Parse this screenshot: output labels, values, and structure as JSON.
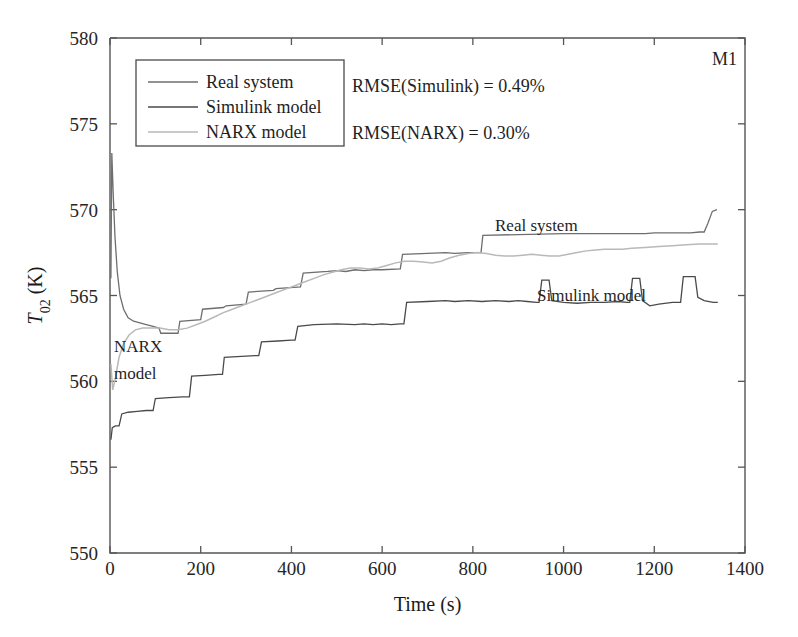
{
  "panel": {
    "id": "M1"
  },
  "annotations": {
    "rmse_simulink": "RMSE(Simulink) = 0.49%",
    "rmse_narx": "RMSE(NARX) = 0.30%",
    "label_real": "Real system",
    "label_simulink": "Simulink model",
    "label_narx_line1": "NARX",
    "label_narx_line2": "model"
  },
  "chart_data": {
    "type": "line",
    "title": "",
    "xlabel": "Time (s)",
    "ylabel": "T02 (K)",
    "ylabel_base": "T",
    "ylabel_sub": "02",
    "ylabel_unit": " (K)",
    "xlim": [
      0,
      1400
    ],
    "ylim": [
      550,
      580
    ],
    "xticks": [
      0,
      200,
      400,
      600,
      800,
      1000,
      1200,
      1400
    ],
    "yticks": [
      550,
      555,
      560,
      565,
      570,
      575,
      580
    ],
    "xtick_labels": [
      "0",
      "200",
      "400",
      "600",
      "800",
      "1000",
      "1200",
      "1400"
    ],
    "ytick_labels": [
      "550",
      "555",
      "560",
      "565",
      "570",
      "575",
      "580"
    ],
    "grid": false,
    "legend_position": "upper-left",
    "colors": {
      "real_system": "#6e6e6e",
      "simulink_model": "#4a4a4a",
      "narx_model": "#b9b9b9",
      "axis": "#555555",
      "text": "#1f1f1f"
    },
    "series": [
      {
        "name": "Real system",
        "color": "#6e6e6e",
        "width": 1.3,
        "points": [
          [
            2,
            566.0
          ],
          [
            4,
            573.3
          ],
          [
            7,
            571.0
          ],
          [
            11,
            568.4
          ],
          [
            16,
            566.4
          ],
          [
            22,
            565.0
          ],
          [
            30,
            564.2
          ],
          [
            40,
            563.7
          ],
          [
            52,
            563.5
          ],
          [
            66,
            563.4
          ],
          [
            80,
            563.3
          ],
          [
            95,
            563.2
          ],
          [
            108,
            563.1
          ],
          [
            112,
            562.8
          ],
          [
            150,
            562.8
          ],
          [
            154,
            563.5
          ],
          [
            200,
            563.6
          ],
          [
            204,
            564.2
          ],
          [
            250,
            564.3
          ],
          [
            256,
            564.4
          ],
          [
            300,
            564.5
          ],
          [
            305,
            565.2
          ],
          [
            360,
            565.3
          ],
          [
            366,
            565.4
          ],
          [
            420,
            565.5
          ],
          [
            426,
            566.3
          ],
          [
            480,
            566.4
          ],
          [
            500,
            566.45
          ],
          [
            520,
            566.4
          ],
          [
            540,
            566.5
          ],
          [
            560,
            566.45
          ],
          [
            580,
            566.5
          ],
          [
            600,
            566.5
          ],
          [
            640,
            566.55
          ],
          [
            645,
            567.4
          ],
          [
            700,
            567.45
          ],
          [
            740,
            567.5
          ],
          [
            760,
            567.45
          ],
          [
            790,
            567.5
          ],
          [
            800,
            567.5
          ],
          [
            818,
            567.5
          ],
          [
            822,
            568.5
          ],
          [
            900,
            568.55
          ],
          [
            1000,
            568.6
          ],
          [
            1100,
            568.6
          ],
          [
            1180,
            568.6
          ],
          [
            1200,
            568.65
          ],
          [
            1280,
            568.65
          ],
          [
            1300,
            568.7
          ],
          [
            1310,
            568.7
          ],
          [
            1318,
            569.2
          ],
          [
            1328,
            569.9
          ],
          [
            1338,
            570.0
          ]
        ]
      },
      {
        "name": "NARX model",
        "color": "#b9b9b9",
        "width": 1.5,
        "points": [
          [
            2,
            561.0
          ],
          [
            6,
            559.5
          ],
          [
            12,
            560.2
          ],
          [
            20,
            561.4
          ],
          [
            30,
            562.2
          ],
          [
            42,
            562.7
          ],
          [
            56,
            563.0
          ],
          [
            72,
            563.1
          ],
          [
            90,
            563.1
          ],
          [
            110,
            563.1
          ],
          [
            130,
            563.0
          ],
          [
            150,
            563.0
          ],
          [
            170,
            563.1
          ],
          [
            190,
            563.3
          ],
          [
            210,
            563.5
          ],
          [
            230,
            563.75
          ],
          [
            250,
            564.0
          ],
          [
            270,
            564.2
          ],
          [
            290,
            564.4
          ],
          [
            310,
            564.6
          ],
          [
            330,
            564.8
          ],
          [
            350,
            565.0
          ],
          [
            370,
            565.2
          ],
          [
            390,
            565.4
          ],
          [
            410,
            565.6
          ],
          [
            430,
            565.8
          ],
          [
            450,
            566.0
          ],
          [
            470,
            566.2
          ],
          [
            490,
            566.35
          ],
          [
            510,
            566.5
          ],
          [
            530,
            566.6
          ],
          [
            550,
            566.6
          ],
          [
            570,
            566.55
          ],
          [
            590,
            566.6
          ],
          [
            610,
            566.75
          ],
          [
            630,
            566.9
          ],
          [
            650,
            567.0
          ],
          [
            670,
            567.0
          ],
          [
            690,
            566.95
          ],
          [
            710,
            566.9
          ],
          [
            730,
            567.0
          ],
          [
            750,
            567.2
          ],
          [
            770,
            567.35
          ],
          [
            790,
            567.45
          ],
          [
            810,
            567.5
          ],
          [
            830,
            567.45
          ],
          [
            850,
            567.35
          ],
          [
            870,
            567.3
          ],
          [
            890,
            567.3
          ],
          [
            910,
            567.35
          ],
          [
            930,
            567.4
          ],
          [
            950,
            567.35
          ],
          [
            970,
            567.3
          ],
          [
            990,
            567.3
          ],
          [
            1010,
            567.4
          ],
          [
            1030,
            567.5
          ],
          [
            1050,
            567.6
          ],
          [
            1070,
            567.65
          ],
          [
            1090,
            567.7
          ],
          [
            1110,
            567.7
          ],
          [
            1130,
            567.7
          ],
          [
            1150,
            567.75
          ],
          [
            1180,
            567.8
          ],
          [
            1210,
            567.85
          ],
          [
            1240,
            567.9
          ],
          [
            1270,
            567.95
          ],
          [
            1300,
            568.0
          ],
          [
            1330,
            568.0
          ],
          [
            1340,
            568.0
          ]
        ]
      },
      {
        "name": "Simulink model",
        "color": "#4a4a4a",
        "width": 1.3,
        "points": [
          [
            2,
            556.6
          ],
          [
            5,
            557.3
          ],
          [
            12,
            557.4
          ],
          [
            20,
            557.4
          ],
          [
            26,
            558.1
          ],
          [
            40,
            558.2
          ],
          [
            60,
            558.25
          ],
          [
            80,
            558.3
          ],
          [
            95,
            558.3
          ],
          [
            100,
            559.0
          ],
          [
            130,
            559.05
          ],
          [
            160,
            559.1
          ],
          [
            175,
            559.1
          ],
          [
            180,
            560.3
          ],
          [
            210,
            560.35
          ],
          [
            240,
            560.4
          ],
          [
            248,
            560.4
          ],
          [
            252,
            561.4
          ],
          [
            290,
            561.45
          ],
          [
            320,
            561.5
          ],
          [
            328,
            561.5
          ],
          [
            334,
            562.3
          ],
          [
            370,
            562.35
          ],
          [
            400,
            562.4
          ],
          [
            408,
            562.4
          ],
          [
            414,
            563.2
          ],
          [
            450,
            563.3
          ],
          [
            500,
            563.35
          ],
          [
            540,
            563.3
          ],
          [
            560,
            563.35
          ],
          [
            580,
            563.3
          ],
          [
            600,
            563.35
          ],
          [
            620,
            563.3
          ],
          [
            640,
            563.35
          ],
          [
            648,
            563.35
          ],
          [
            654,
            564.6
          ],
          [
            700,
            564.65
          ],
          [
            740,
            564.7
          ],
          [
            760,
            564.65
          ],
          [
            790,
            564.7
          ],
          [
            820,
            564.65
          ],
          [
            850,
            564.7
          ],
          [
            880,
            564.65
          ],
          [
            900,
            564.7
          ],
          [
            920,
            564.65
          ],
          [
            940,
            564.6
          ],
          [
            946,
            564.6
          ],
          [
            952,
            565.9
          ],
          [
            968,
            565.9
          ],
          [
            974,
            564.7
          ],
          [
            1000,
            564.6
          ],
          [
            1030,
            564.55
          ],
          [
            1060,
            564.6
          ],
          [
            1090,
            564.6
          ],
          [
            1120,
            564.65
          ],
          [
            1140,
            564.6
          ],
          [
            1146,
            564.6
          ],
          [
            1152,
            566.0
          ],
          [
            1168,
            566.0
          ],
          [
            1174,
            564.7
          ],
          [
            1190,
            564.4
          ],
          [
            1210,
            564.5
          ],
          [
            1240,
            564.6
          ],
          [
            1258,
            564.6
          ],
          [
            1264,
            566.1
          ],
          [
            1290,
            566.1
          ],
          [
            1296,
            564.9
          ],
          [
            1310,
            564.7
          ],
          [
            1330,
            564.6
          ],
          [
            1340,
            564.6
          ]
        ]
      }
    ]
  },
  "legend": {
    "items": [
      {
        "label": "Real system",
        "color": "#6e6e6e"
      },
      {
        "label": "Simulink model",
        "color": "#4a4a4a"
      },
      {
        "label": "NARX model",
        "color": "#b9b9b9"
      }
    ]
  }
}
